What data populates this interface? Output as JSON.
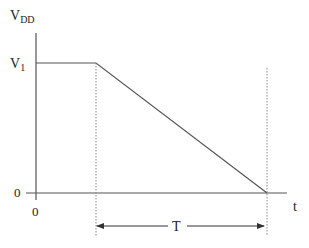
{
  "diagram": {
    "type": "voltage-vs-time waveform",
    "y_axis": {
      "label_main": "V",
      "label_sub": "DD"
    },
    "x_axis": {
      "label": "t"
    },
    "levels": {
      "v1": {
        "main": "V",
        "sub": "1"
      },
      "zero_y": "0",
      "zero_x": "0"
    },
    "interval": {
      "label": "T"
    },
    "colors": {
      "line": "#555555",
      "dotted": "#888888",
      "text": "#222222"
    }
  }
}
